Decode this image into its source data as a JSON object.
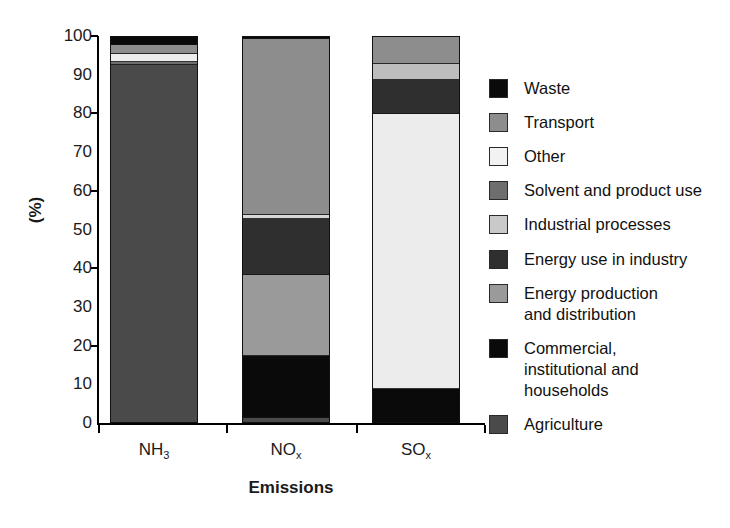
{
  "chart_data": {
    "type": "bar",
    "stacked": true,
    "title": "",
    "xlabel": "Emissions",
    "ylabel": "(%)",
    "ylim": [
      0,
      100
    ],
    "ytick_labels": [
      "100",
      "90",
      "80",
      "70",
      "60",
      "50",
      "40",
      "30",
      "20",
      "10",
      "0"
    ],
    "ytick_values": [
      100,
      90,
      80,
      70,
      60,
      50,
      40,
      30,
      20,
      10,
      0
    ],
    "grid": false,
    "legend_position": "right",
    "categories": [
      "NH3",
      "NOx",
      "SOx"
    ],
    "category_labels": [
      {
        "base": "NH",
        "sub": "3"
      },
      {
        "base": "NO",
        "sub": "x"
      },
      {
        "base": "SO",
        "sub": "x"
      }
    ],
    "series": [
      {
        "name": "Waste",
        "color": "#0a0a0a",
        "values": [
          2.0,
          0.5,
          0.0
        ]
      },
      {
        "name": "Transport",
        "color": "#8d8d8d",
        "values": [
          2.5,
          45.5,
          7.0
        ]
      },
      {
        "name": "Other",
        "color": "#ececec",
        "values": [
          2.0,
          0.0,
          0.0
        ]
      },
      {
        "name": "Solvent and product use",
        "color": "#6e6e6e",
        "values": [
          0.8,
          1.0,
          1.0
        ]
      },
      {
        "name": "Industrial processes",
        "color": "#c9c9c9",
        "values": [
          0.0,
          0.0,
          5.0
        ]
      },
      {
        "name": "Energy use in industry",
        "color": "#2f2f2f",
        "values": [
          0.0,
          14.5,
          8.0
        ]
      },
      {
        "name": "Energy production\nand distribution",
        "color": "#9a9a9a",
        "values": [
          0.0,
          21.0,
          0.0
        ]
      },
      {
        "name": "Commercial,\ninstitutional and\nhouseholds",
        "color": "#0a0a0a",
        "values": [
          0.0,
          16.0,
          9.0
        ]
      },
      {
        "name": "Agriculture",
        "color": "#4a4a4a",
        "values": [
          92.7,
          1.5,
          0.0
        ]
      }
    ],
    "stack_order_top_to_bottom": [
      "Waste",
      "Transport",
      "Other",
      "Solvent and product use",
      "Industrial processes",
      "Energy use in industry",
      "Energy production and distribution",
      "Commercial, institutional and households",
      "Agriculture"
    ],
    "bars": [
      {
        "category": "NH3",
        "segments_top_to_bottom": [
          {
            "name": "Waste",
            "color": "#0a0a0a",
            "value": 2.0
          },
          {
            "name": "Transport",
            "color": "#8d8d8d",
            "value": 2.5
          },
          {
            "name": "Other",
            "color": "#ececec",
            "value": 2.0
          },
          {
            "name": "Solvent and product use",
            "color": "#6e6e6e",
            "value": 0.8
          },
          {
            "name": "Agriculture",
            "color": "#4a4a4a",
            "value": 92.7
          }
        ]
      },
      {
        "category": "NOx",
        "segments_top_to_bottom": [
          {
            "name": "Waste",
            "color": "#0a0a0a",
            "value": 0.5
          },
          {
            "name": "Transport",
            "color": "#8d8d8d",
            "value": 45.5
          },
          {
            "name": "Solvent and product use",
            "color": "#d8d8d8",
            "value": 1.0
          },
          {
            "name": "Energy use in industry",
            "color": "#2f2f2f",
            "value": 14.5
          },
          {
            "name": "Energy production and distribution",
            "color": "#9a9a9a",
            "value": 21.0
          },
          {
            "name": "Commercial, institutional and households",
            "color": "#0a0a0a",
            "value": 16.0
          },
          {
            "name": "Agriculture",
            "color": "#4a4a4a",
            "value": 1.5
          }
        ]
      },
      {
        "category": "SOx",
        "segments_top_to_bottom": [
          {
            "name": "Transport",
            "color": "#8d8d8d",
            "value": 7.0
          },
          {
            "name": "Solvent and product use",
            "color": "#bdbdbd",
            "value": 4.0
          },
          {
            "name": "Energy use in industry",
            "color": "#2f2f2f",
            "value": 9.0
          },
          {
            "name": "Industrial processes",
            "color": "#ececec",
            "value": 71.0
          },
          {
            "name": "Commercial, institutional and households",
            "color": "#0a0a0a",
            "value": 9.0
          }
        ]
      }
    ]
  },
  "legend": {
    "items": [
      {
        "label": "Waste",
        "color": "#0a0a0a"
      },
      {
        "label": "Transport",
        "color": "#8d8d8d"
      },
      {
        "label": "Other",
        "color": "#f2f2f2"
      },
      {
        "label": "Solvent and product use",
        "color": "#6e6e6e"
      },
      {
        "label": "Industrial processes",
        "color": "#c9c9c9"
      },
      {
        "label": "Energy use in industry",
        "color": "#2f2f2f"
      },
      {
        "label": "Energy production\nand distribution",
        "color": "#9a9a9a"
      },
      {
        "label": "Commercial,\ninstitutional and\nhouseholds",
        "color": "#0a0a0a"
      },
      {
        "label": "Agriculture",
        "color": "#4a4a4a"
      }
    ]
  }
}
